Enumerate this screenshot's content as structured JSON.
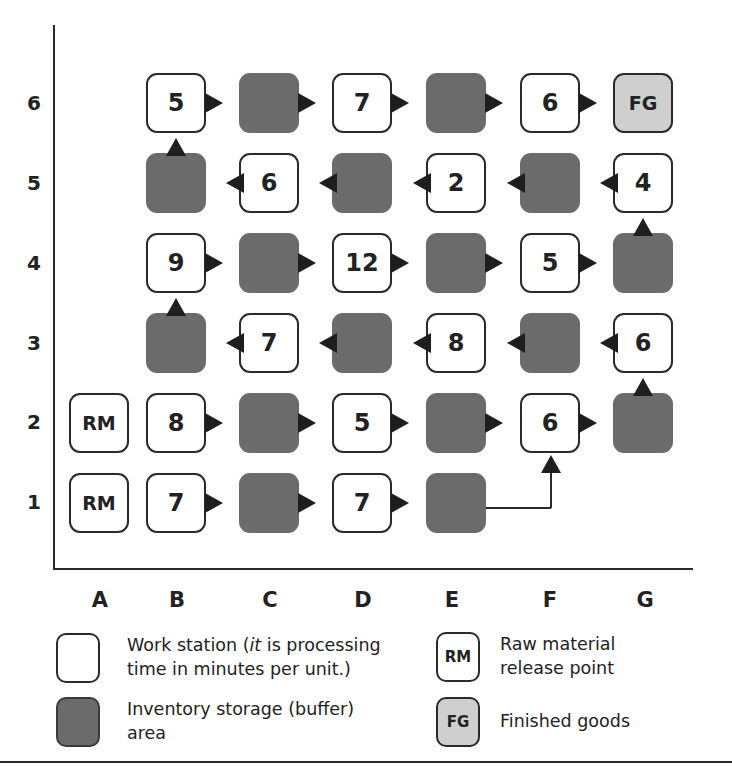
{
  "diagram": {
    "type": "process-layout-grid",
    "row_labels": [
      "6",
      "5",
      "4",
      "3",
      "2",
      "1"
    ],
    "column_labels": [
      "A",
      "B",
      "C",
      "D",
      "E",
      "F",
      "G"
    ],
    "cells": [
      {
        "id": "A2",
        "col": "A",
        "row": 2,
        "type": "raw-material",
        "label": "RM"
      },
      {
        "id": "A1",
        "col": "A",
        "row": 1,
        "type": "raw-material",
        "label": "RM"
      },
      {
        "id": "B1",
        "col": "B",
        "row": 1,
        "type": "workstation",
        "label": "7"
      },
      {
        "id": "C1",
        "col": "C",
        "row": 1,
        "type": "buffer",
        "label": ""
      },
      {
        "id": "D1",
        "col": "D",
        "row": 1,
        "type": "workstation",
        "label": "7"
      },
      {
        "id": "E1",
        "col": "E",
        "row": 1,
        "type": "buffer",
        "label": ""
      },
      {
        "id": "B2",
        "col": "B",
        "row": 2,
        "type": "workstation",
        "label": "8"
      },
      {
        "id": "C2",
        "col": "C",
        "row": 2,
        "type": "buffer",
        "label": ""
      },
      {
        "id": "D2",
        "col": "D",
        "row": 2,
        "type": "workstation",
        "label": "5"
      },
      {
        "id": "E2",
        "col": "E",
        "row": 2,
        "type": "buffer",
        "label": ""
      },
      {
        "id": "F2",
        "col": "F",
        "row": 2,
        "type": "workstation",
        "label": "6"
      },
      {
        "id": "G2",
        "col": "G",
        "row": 2,
        "type": "buffer",
        "label": ""
      },
      {
        "id": "G3",
        "col": "G",
        "row": 3,
        "type": "workstation",
        "label": "6"
      },
      {
        "id": "F3",
        "col": "F",
        "row": 3,
        "type": "buffer",
        "label": ""
      },
      {
        "id": "E3",
        "col": "E",
        "row": 3,
        "type": "workstation",
        "label": "8"
      },
      {
        "id": "D3",
        "col": "D",
        "row": 3,
        "type": "buffer",
        "label": ""
      },
      {
        "id": "C3",
        "col": "C",
        "row": 3,
        "type": "workstation",
        "label": "7"
      },
      {
        "id": "B3",
        "col": "B",
        "row": 3,
        "type": "buffer",
        "label": ""
      },
      {
        "id": "B4",
        "col": "B",
        "row": 4,
        "type": "workstation",
        "label": "9"
      },
      {
        "id": "C4",
        "col": "C",
        "row": 4,
        "type": "buffer",
        "label": ""
      },
      {
        "id": "D4",
        "col": "D",
        "row": 4,
        "type": "workstation",
        "label": "12"
      },
      {
        "id": "E4",
        "col": "E",
        "row": 4,
        "type": "buffer",
        "label": ""
      },
      {
        "id": "F4",
        "col": "F",
        "row": 4,
        "type": "workstation",
        "label": "5"
      },
      {
        "id": "G4",
        "col": "G",
        "row": 4,
        "type": "buffer",
        "label": ""
      },
      {
        "id": "G5",
        "col": "G",
        "row": 5,
        "type": "workstation",
        "label": "4"
      },
      {
        "id": "F5",
        "col": "F",
        "row": 5,
        "type": "buffer",
        "label": ""
      },
      {
        "id": "E5",
        "col": "E",
        "row": 5,
        "type": "workstation",
        "label": "2"
      },
      {
        "id": "D5",
        "col": "D",
        "row": 5,
        "type": "buffer",
        "label": ""
      },
      {
        "id": "C5",
        "col": "C",
        "row": 5,
        "type": "workstation",
        "label": "6"
      },
      {
        "id": "B5",
        "col": "B",
        "row": 5,
        "type": "buffer",
        "label": ""
      },
      {
        "id": "B6",
        "col": "B",
        "row": 6,
        "type": "workstation",
        "label": "5"
      },
      {
        "id": "C6",
        "col": "C",
        "row": 6,
        "type": "buffer",
        "label": ""
      },
      {
        "id": "D6",
        "col": "D",
        "row": 6,
        "type": "workstation",
        "label": "7"
      },
      {
        "id": "E6",
        "col": "E",
        "row": 6,
        "type": "buffer",
        "label": ""
      },
      {
        "id": "F6",
        "col": "F",
        "row": 6,
        "type": "workstation",
        "label": "6"
      },
      {
        "id": "G6",
        "col": "G",
        "row": 6,
        "type": "finished-goods",
        "label": "FG"
      }
    ],
    "flows": [
      "B1→C1",
      "C1→D1",
      "D1→E1",
      "E1→F2",
      "B2→C2",
      "C2→D2",
      "D2→E2",
      "E2→F2",
      "F2→G2",
      "G2→G3",
      "G3→F3",
      "F3→E3",
      "E3→D3",
      "D3→C3",
      "C3→B3",
      "B3→B4",
      "B4→C4",
      "C4→D4",
      "D4→E4",
      "E4→F4",
      "F4→G4",
      "G4→G5",
      "G5→F5",
      "F5→E5",
      "E5→D5",
      "D5→C5",
      "C5→B5",
      "B5→B6",
      "B6→C6",
      "C6→D6",
      "D6→E6",
      "E6→F6",
      "F6→G6"
    ]
  },
  "legend": {
    "workstation": {
      "text_prefix": "Work station (",
      "text_italic": "it",
      "text_suffix": " is processing",
      "text_line2": "time in minutes per unit.)"
    },
    "buffer": {
      "text_line1": "Inventory storage (buffer)",
      "text_line2": "area"
    },
    "raw_material": {
      "box_label": "RM",
      "text_line1": "Raw material",
      "text_line2": "release point"
    },
    "finished_goods": {
      "box_label": "FG",
      "text_line1": "Finished goods"
    }
  },
  "colors": {
    "workstation_fill": "#ffffff",
    "buffer_fill": "#6b6b6b",
    "finished_goods_fill": "#cfcfcf",
    "stroke": "#2a2a2a"
  }
}
